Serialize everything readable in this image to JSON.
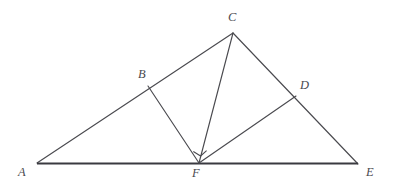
{
  "figure": {
    "width": 394,
    "height": 188,
    "background_color": "#ffffff",
    "line_color": "#4a4a4f",
    "base_line_color": "#3a3a40",
    "label_color": "#4a4a4f"
  },
  "points": {
    "A": {
      "label": "A",
      "x": 37,
      "y": 163,
      "label_x": 18,
      "label_y": 166
    },
    "B": {
      "label": "B",
      "x": 148,
      "y": 86,
      "label_x": 138,
      "label_y": 68
    },
    "C": {
      "label": "C",
      "x": 233,
      "y": 33,
      "label_x": 228,
      "label_y": 11
    },
    "D": {
      "label": "D",
      "x": 296,
      "y": 96,
      "label_x": 300,
      "label_y": 79
    },
    "E": {
      "label": "E",
      "x": 358,
      "y": 164,
      "label_x": 366,
      "label_y": 166
    },
    "F": {
      "label": "F",
      "x": 199,
      "y": 163,
      "label_x": 192,
      "label_y": 167
    }
  },
  "segments": [
    {
      "name": "segment-A-C",
      "from": "A",
      "to": "C",
      "style": "thin"
    },
    {
      "name": "segment-C-E",
      "from": "C",
      "to": "E",
      "style": "thin"
    },
    {
      "name": "segment-A-E",
      "from": "A",
      "to": "E",
      "style": "base"
    },
    {
      "name": "segment-B-F",
      "from": "B",
      "to": "F",
      "style": "thin"
    },
    {
      "name": "segment-C-F",
      "from": "C",
      "to": "F",
      "style": "thin"
    },
    {
      "name": "segment-F-D",
      "from": "F",
      "to": "D",
      "style": "thin"
    }
  ],
  "angle_markers": [
    {
      "name": "right-angle-marker-BFD",
      "vertex": "F",
      "between": [
        "B",
        "D"
      ],
      "type": "right-angle",
      "path": "M 193.3 151.5 L 200.6 156.0 L 206.6 150.7"
    }
  ],
  "labels_order": [
    "C",
    "B",
    "D",
    "A",
    "F",
    "E"
  ]
}
